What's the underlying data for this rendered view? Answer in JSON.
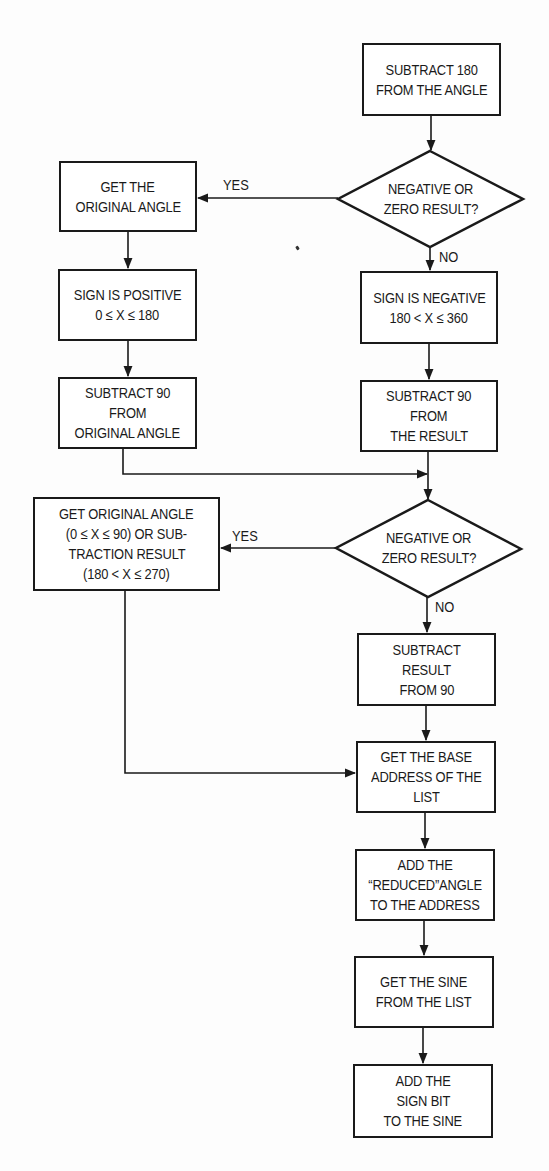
{
  "flowchart": {
    "title": "",
    "nodes": {
      "n1": {
        "type": "process",
        "lines": [
          "SUBTRACT 180",
          "FROM THE ANGLE"
        ]
      },
      "d1": {
        "type": "decision",
        "lines": [
          "NEGATIVE OR",
          "ZERO RESULT?"
        ]
      },
      "n2": {
        "type": "process",
        "lines": [
          "GET THE",
          "ORIGINAL ANGLE"
        ]
      },
      "n3": {
        "type": "process",
        "lines": [
          "SIGN IS POSITIVE",
          "0 ≤ X ≤ 180"
        ]
      },
      "n4": {
        "type": "process",
        "lines": [
          "SUBTRACT 90",
          "FROM",
          "ORIGINAL ANGLE"
        ]
      },
      "n5": {
        "type": "process",
        "lines": [
          "SIGN IS NEGATIVE",
          "180 < X ≤ 360"
        ]
      },
      "n6": {
        "type": "process",
        "lines": [
          "SUBTRACT 90",
          "FROM",
          "THE RESULT"
        ]
      },
      "d2": {
        "type": "decision",
        "lines": [
          "NEGATIVE OR",
          "ZERO RESULT?"
        ]
      },
      "n7": {
        "type": "process",
        "lines": [
          "GET ORIGINAL ANGLE",
          "(0 ≤ X ≤ 90) OR SUB-",
          "TRACTION RESULT",
          "(180 < X ≤ 270)"
        ]
      },
      "n8": {
        "type": "process",
        "lines": [
          "SUBTRACT",
          "RESULT",
          "FROM 90"
        ]
      },
      "n9": {
        "type": "process",
        "lines": [
          "GET THE BASE",
          "ADDRESS OF THE",
          "LIST"
        ]
      },
      "n10": {
        "type": "process",
        "lines": [
          "ADD THE",
          "“REDUCED”ANGLE",
          "TO THE ADDRESS"
        ]
      },
      "n11": {
        "type": "process",
        "lines": [
          "GET THE SINE",
          "FROM THE LIST"
        ]
      },
      "n12": {
        "type": "process",
        "lines": [
          "ADD THE",
          "SIGN BIT",
          "TO THE SINE"
        ]
      }
    },
    "edge_labels": {
      "d1_yes": "YES",
      "d1_no": "NO",
      "d2_yes": "YES",
      "d2_no": "NO"
    },
    "edges": [
      {
        "from": "n1",
        "to": "d1",
        "label": ""
      },
      {
        "from": "d1",
        "to": "n2",
        "label": "YES"
      },
      {
        "from": "d1",
        "to": "n5",
        "label": "NO"
      },
      {
        "from": "n2",
        "to": "n3",
        "label": ""
      },
      {
        "from": "n3",
        "to": "n4",
        "label": ""
      },
      {
        "from": "n5",
        "to": "n6",
        "label": ""
      },
      {
        "from": "n4",
        "to": "d2",
        "label": ""
      },
      {
        "from": "n6",
        "to": "d2",
        "label": ""
      },
      {
        "from": "d2",
        "to": "n7",
        "label": "YES"
      },
      {
        "from": "d2",
        "to": "n8",
        "label": "NO"
      },
      {
        "from": "n7",
        "to": "n9",
        "label": ""
      },
      {
        "from": "n8",
        "to": "n9",
        "label": ""
      },
      {
        "from": "n9",
        "to": "n10",
        "label": ""
      },
      {
        "from": "n10",
        "to": "n11",
        "label": ""
      },
      {
        "from": "n11",
        "to": "n12",
        "label": ""
      }
    ],
    "colors": {
      "ink": "#1a1a1a",
      "paper": "#fdfdfd"
    }
  }
}
